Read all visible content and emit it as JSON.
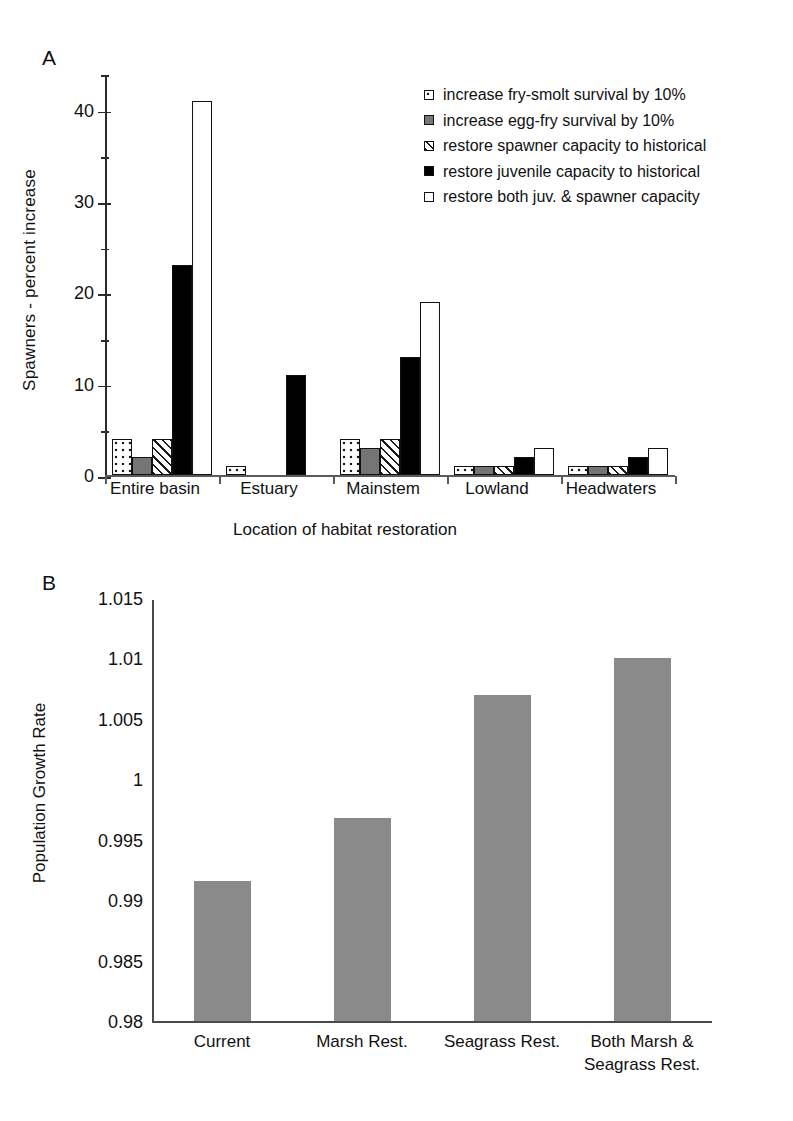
{
  "figure": {
    "panel_a_label": "A",
    "panel_b_label": "B"
  },
  "chart_data": [
    {
      "type": "bar",
      "panel": "A",
      "title": "",
      "xlabel": "Location of habitat restoration",
      "ylabel": "Spawners - percent increase",
      "ylim": [
        0,
        44
      ],
      "yticks": [
        0,
        10,
        20,
        30,
        40
      ],
      "ytick_labels": [
        "0",
        "10",
        "20",
        "30",
        "40"
      ],
      "minor_tick_interval": 5,
      "grid": false,
      "legend_position": "upper right inside",
      "categories": [
        "Entire basin",
        "Estuary",
        "Mainstem",
        "Lowland",
        "Headwaters"
      ],
      "series": [
        {
          "name": "increase fry-smolt survival by 10%",
          "fill": "white-with-dots",
          "values": [
            4,
            1,
            4,
            1,
            1
          ]
        },
        {
          "name": "increase egg-fry survival by 10%",
          "fill": "solid-gray",
          "values": [
            2,
            0,
            3,
            1,
            1
          ]
        },
        {
          "name": "restore spawner capacity to historical",
          "fill": "diagonal-hatch",
          "values": [
            4,
            0,
            4,
            1,
            1
          ]
        },
        {
          "name": "restore juvenile capacity to historical",
          "fill": "solid-black",
          "values": [
            23,
            11,
            13,
            2,
            2
          ]
        },
        {
          "name": "restore both juv. & spawner capacity",
          "fill": "white-outline",
          "values": [
            41,
            0,
            19,
            3,
            3
          ]
        }
      ]
    },
    {
      "type": "bar",
      "panel": "B",
      "title": "",
      "xlabel": "",
      "ylabel": "Population Growth Rate",
      "ylim": [
        0.98,
        1.015
      ],
      "yticks": [
        0.98,
        0.985,
        0.99,
        0.995,
        1.0,
        1.005,
        1.01,
        1.015
      ],
      "ytick_labels": [
        "0.98",
        "0.985",
        "0.99",
        "0.995",
        "1",
        "1.005",
        "1.01",
        "1.015"
      ],
      "grid": false,
      "bar_color": "#8a8a8a",
      "categories": [
        "Current",
        "Marsh Rest.",
        "Seagrass Rest.",
        "Both Marsh &\nSeagrass Rest."
      ],
      "category_lines": [
        [
          "Current"
        ],
        [
          "Marsh Rest."
        ],
        [
          "Seagrass Rest."
        ],
        [
          "Both Marsh &",
          "Seagrass Rest."
        ]
      ],
      "values": [
        0.9917,
        0.9969,
        1.0071,
        1.0102
      ]
    }
  ]
}
